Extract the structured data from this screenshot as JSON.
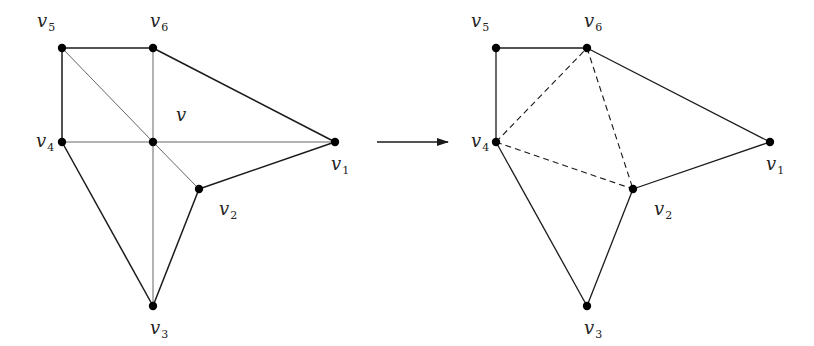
{
  "diagram": {
    "colors": {
      "edge": "#1a1a1a",
      "thin_edge": "#555555",
      "vertex": "#000000",
      "background": "#ffffff"
    },
    "left": {
      "center_vertex": {
        "id": "v",
        "label": "v",
        "x": 153,
        "y": 142,
        "label_x": 176,
        "label_y": 121
      },
      "vertices": [
        {
          "id": "v1",
          "base": "v",
          "sub": "1",
          "x": 335,
          "y": 142,
          "label_x": 331,
          "label_y": 170
        },
        {
          "id": "v2",
          "base": "v",
          "sub": "2",
          "x": 199,
          "y": 189,
          "label_x": 219,
          "label_y": 215
        },
        {
          "id": "v3",
          "base": "v",
          "sub": "3",
          "x": 153,
          "y": 306,
          "label_x": 150,
          "label_y": 334
        },
        {
          "id": "v4",
          "base": "v",
          "sub": "4",
          "x": 62,
          "y": 142,
          "label_x": 36,
          "label_y": 147
        },
        {
          "id": "v5",
          "base": "v",
          "sub": "5",
          "x": 62,
          "y": 48,
          "label_x": 37,
          "label_y": 27
        },
        {
          "id": "v6",
          "base": "v",
          "sub": "6",
          "x": 153,
          "y": 48,
          "label_x": 150,
          "label_y": 27
        }
      ],
      "outer_edges": [
        [
          "v5",
          "v6"
        ],
        [
          "v6",
          "v1"
        ],
        [
          "v1",
          "v2"
        ],
        [
          "v2",
          "v3"
        ],
        [
          "v3",
          "v4"
        ],
        [
          "v4",
          "v5"
        ]
      ],
      "spoke_edges": [
        [
          "v",
          "v1"
        ],
        [
          "v",
          "v2"
        ],
        [
          "v",
          "v3"
        ],
        [
          "v",
          "v4"
        ],
        [
          "v",
          "v5"
        ],
        [
          "v",
          "v6"
        ]
      ]
    },
    "arrow": {
      "x1": 377,
      "y1": 142,
      "x2": 448,
      "y2": 142
    },
    "right": {
      "vertices": [
        {
          "id": "v1",
          "base": "v",
          "sub": "1",
          "x": 770,
          "y": 142,
          "label_x": 766,
          "label_y": 170
        },
        {
          "id": "v2",
          "base": "v",
          "sub": "2",
          "x": 633,
          "y": 189,
          "label_x": 654,
          "label_y": 215
        },
        {
          "id": "v3",
          "base": "v",
          "sub": "3",
          "x": 587,
          "y": 306,
          "label_x": 584,
          "label_y": 334
        },
        {
          "id": "v4",
          "base": "v",
          "sub": "4",
          "x": 496,
          "y": 142,
          "label_x": 471,
          "label_y": 147
        },
        {
          "id": "v5",
          "base": "v",
          "sub": "5",
          "x": 496,
          "y": 48,
          "label_x": 471,
          "label_y": 27
        },
        {
          "id": "v6",
          "base": "v",
          "sub": "6",
          "x": 587,
          "y": 48,
          "label_x": 584,
          "label_y": 27
        }
      ],
      "solid_edges": [
        [
          "v5",
          "v6"
        ],
        [
          "v6",
          "v1"
        ],
        [
          "v1",
          "v2"
        ],
        [
          "v2",
          "v3"
        ],
        [
          "v3",
          "v4"
        ],
        [
          "v4",
          "v5"
        ]
      ],
      "dashed_edges": [
        [
          "v4",
          "v6"
        ],
        [
          "v6",
          "v2"
        ],
        [
          "v4",
          "v2"
        ]
      ]
    }
  }
}
